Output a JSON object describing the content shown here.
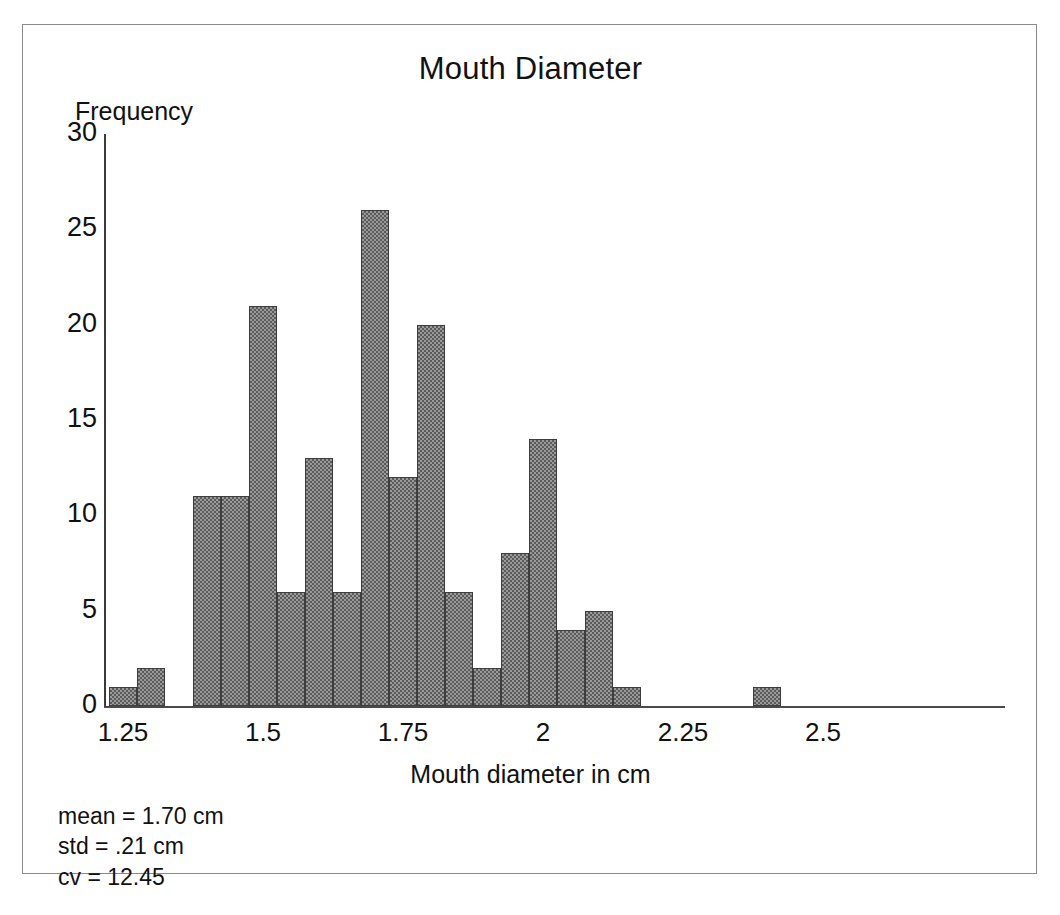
{
  "figure": {
    "title": "Mouth Diameter"
  },
  "axes": {
    "y_label": "Frequency",
    "x_label": "Mouth diameter in cm",
    "y_ticks": [
      "0",
      "5",
      "10",
      "15",
      "20",
      "25",
      "30"
    ],
    "x_ticks": [
      "1.25",
      "1.5",
      "1.75",
      "2",
      "2.25",
      "2.5"
    ]
  },
  "stats": {
    "mean": "mean = 1.70 cm",
    "std": "std = .21 cm",
    "cv": "cv = 12.45"
  },
  "chart_data": {
    "type": "bar",
    "title": "Mouth Diameter",
    "xlabel": "Mouth diameter in cm",
    "ylabel": "Frequency",
    "xlim": [
      1.19,
      2.545
    ],
    "ylim": [
      0,
      30
    ],
    "ytick_values": [
      0,
      5,
      10,
      15,
      20,
      25,
      30
    ],
    "xtick_values": [
      1.25,
      1.5,
      1.75,
      2,
      2.25,
      2.5
    ],
    "grid": false,
    "legend": null,
    "bin_width": 0.05,
    "bins": [
      {
        "left": 1.225,
        "right": 1.275,
        "value": 1
      },
      {
        "left": 1.275,
        "right": 1.325,
        "value": 2
      },
      {
        "left": 1.325,
        "right": 1.375,
        "value": 0
      },
      {
        "left": 1.375,
        "right": 1.425,
        "value": 11
      },
      {
        "left": 1.425,
        "right": 1.475,
        "value": 11
      },
      {
        "left": 1.475,
        "right": 1.525,
        "value": 21
      },
      {
        "left": 1.525,
        "right": 1.575,
        "value": 6
      },
      {
        "left": 1.575,
        "right": 1.625,
        "value": 13
      },
      {
        "left": 1.625,
        "right": 1.675,
        "value": 6
      },
      {
        "left": 1.675,
        "right": 1.725,
        "value": 26
      },
      {
        "left": 1.725,
        "right": 1.775,
        "value": 12
      },
      {
        "left": 1.775,
        "right": 1.825,
        "value": 20
      },
      {
        "left": 1.825,
        "right": 1.875,
        "value": 6
      },
      {
        "left": 1.875,
        "right": 1.925,
        "value": 2
      },
      {
        "left": 1.925,
        "right": 1.975,
        "value": 8
      },
      {
        "left": 1.975,
        "right": 2.025,
        "value": 14
      },
      {
        "left": 2.025,
        "right": 2.075,
        "value": 4
      },
      {
        "left": 2.075,
        "right": 2.125,
        "value": 5
      },
      {
        "left": 2.125,
        "right": 2.175,
        "value": 1
      },
      {
        "left": 2.175,
        "right": 2.225,
        "value": 0
      },
      {
        "left": 2.225,
        "right": 2.275,
        "value": 0
      },
      {
        "left": 2.275,
        "right": 2.325,
        "value": 0
      },
      {
        "left": 2.325,
        "right": 2.375,
        "value": 0
      },
      {
        "left": 2.375,
        "right": 2.425,
        "value": 1
      }
    ],
    "annotations": [
      "mean = 1.70 cm",
      "std = .21 cm",
      "cv = 12.45"
    ]
  },
  "colors": {
    "bar_fill": "#9a9a9a",
    "bar_hatch": "#5b5b5b",
    "bar_edge": "#3d3d3d",
    "axis": "#3a3a3a",
    "frame": "#8a8a8a",
    "text": "#111111",
    "background": "#ffffff"
  }
}
